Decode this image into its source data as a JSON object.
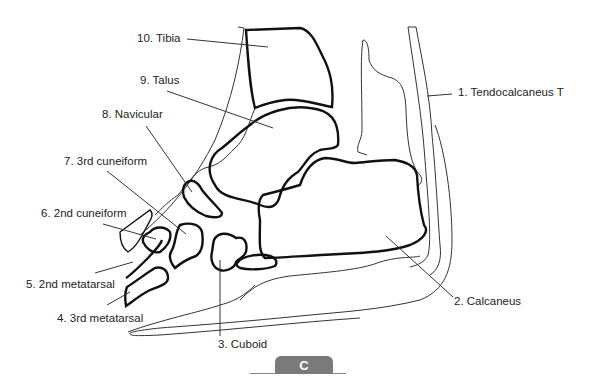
{
  "figure": {
    "panel_label": "C",
    "colors": {
      "bone_outline": "#111111",
      "soft_tissue_outline": "#333333",
      "leader_line": "#333333",
      "label_text": "#222222",
      "panel_tab": "#7a7a7a"
    }
  },
  "labels": [
    {
      "id": "1",
      "text": "1. Tendocalcaneus T",
      "structure": "Tendocalcaneus"
    },
    {
      "id": "2",
      "text": "2. Calcaneus",
      "structure": "Calcaneus"
    },
    {
      "id": "3",
      "text": "3. Cuboid",
      "structure": "Cuboid"
    },
    {
      "id": "4",
      "text": "4. 3rd metatarsal",
      "structure": "3rd metatarsal"
    },
    {
      "id": "5",
      "text": "5. 2nd metatarsal",
      "structure": "2nd metatarsal"
    },
    {
      "id": "6",
      "text": "6. 2nd cuneiform",
      "structure": "2nd cuneiform"
    },
    {
      "id": "7",
      "text": "7. 3rd cuneiform",
      "structure": "3rd cuneiform"
    },
    {
      "id": "8",
      "text": "8. Navicular",
      "structure": "Navicular"
    },
    {
      "id": "9",
      "text": "9. Talus",
      "structure": "Talus"
    },
    {
      "id": "10",
      "text": "10. Tibia",
      "structure": "Tibia"
    }
  ]
}
